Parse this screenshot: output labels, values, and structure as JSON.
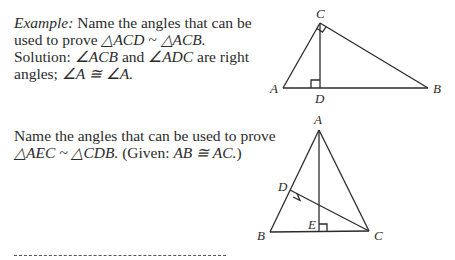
{
  "example": {
    "label": "Example:",
    "line1_rest": " Name the angles that can be",
    "line2_pre": "used to prove ",
    "line2_expr": "△ACD ~ △ACB.",
    "line3_pre": "Solution:  ",
    "line3_a1": "∠ACB",
    "line3_mid": " and ",
    "line3_a2": "∠ADC",
    "line3_post": " are right",
    "line4_pre": "angles; ",
    "line4_expr": "∠A ≅ ∠A."
  },
  "exercise": {
    "line1": "Name the angles that can be used to prove",
    "line2_expr": "△AEC ~ △CDB.",
    "line2_given_pre": "  (Given:  ",
    "line2_given_expr": "AB ≅ AC.",
    "line2_given_post": ")"
  },
  "figure1": {
    "labels": {
      "A": "A",
      "B": "B",
      "C": "C",
      "D": "D"
    }
  },
  "figure2": {
    "labels": {
      "A": "A",
      "B": "B",
      "C": "C",
      "D": "D",
      "E": "E"
    }
  },
  "answer_line": "________________"
}
